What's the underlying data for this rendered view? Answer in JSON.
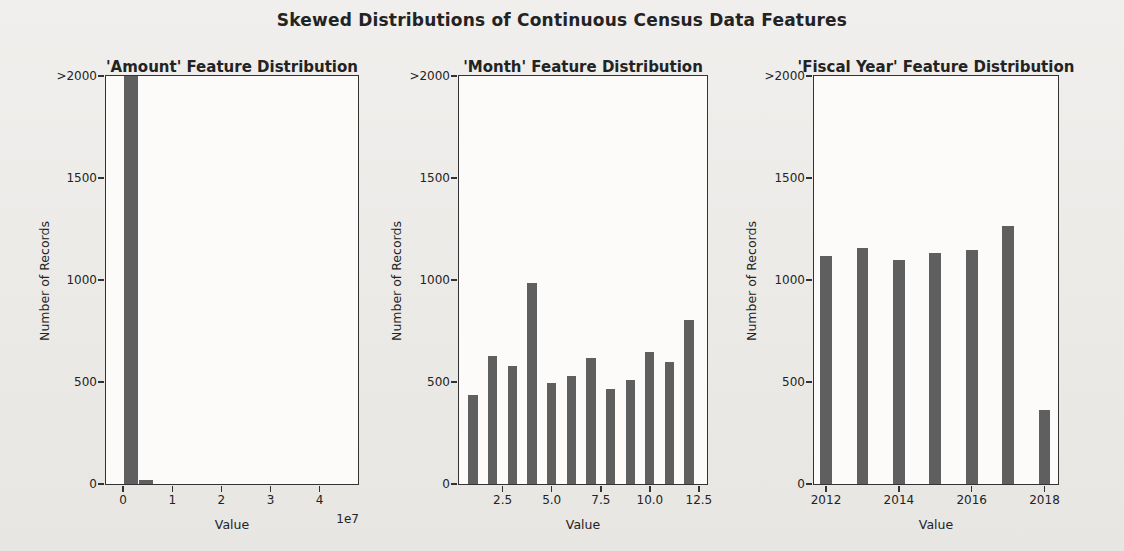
{
  "figure": {
    "title": "Skewed Distributions of Continuous Census Data Features",
    "bar_color": "#5f5f5f",
    "axis_color": "#333333",
    "text_color": "#232323"
  },
  "chart_data": [
    {
      "type": "bar",
      "title": "'Amount' Feature Distribution",
      "xlabel": "Value",
      "ylabel": "Number of Records",
      "x_offset_label": "1e7",
      "xlim": [
        -3500000,
        47800000
      ],
      "ylim": [
        0,
        2000
      ],
      "grid": false,
      "legend": null,
      "yticks": [
        {
          "value": 0,
          "label": "0"
        },
        {
          "value": 500,
          "label": "500"
        },
        {
          "value": 1000,
          "label": "1000"
        },
        {
          "value": 1500,
          "label": "1500"
        },
        {
          "value": 2000,
          "label": ">2000"
        }
      ],
      "xticks": [
        {
          "value": 0,
          "label": "0"
        },
        {
          "value": 10000000,
          "label": "1"
        },
        {
          "value": 20000000,
          "label": "2"
        },
        {
          "value": 30000000,
          "label": "3"
        },
        {
          "value": 40000000,
          "label": "4"
        }
      ],
      "bars": [
        {
          "x": 1600000,
          "width": 2900000,
          "count": 2350,
          "clipped": true
        },
        {
          "x": 4600000,
          "width": 2900000,
          "count": 20,
          "clipped": false
        }
      ]
    },
    {
      "type": "bar",
      "title": "'Month' Feature Distribution",
      "xlabel": "Value",
      "ylabel": "Number of Records",
      "x_offset_label": null,
      "xlim": [
        0.28,
        12.91
      ],
      "ylim": [
        0,
        2000
      ],
      "grid": false,
      "legend": null,
      "bar_width": 0.48,
      "yticks": [
        {
          "value": 0,
          "label": "0"
        },
        {
          "value": 500,
          "label": "500"
        },
        {
          "value": 1000,
          "label": "1000"
        },
        {
          "value": 1500,
          "label": "1500"
        },
        {
          "value": 2000,
          "label": ">2000"
        }
      ],
      "xticks": [
        {
          "value": 2.5,
          "label": "2.5"
        },
        {
          "value": 5.0,
          "label": "5.0"
        },
        {
          "value": 7.5,
          "label": "7.5"
        },
        {
          "value": 10.0,
          "label": "10.0"
        },
        {
          "value": 12.5,
          "label": "12.5"
        }
      ],
      "bars": [
        {
          "x": 1,
          "count": 435
        },
        {
          "x": 2,
          "count": 630
        },
        {
          "x": 3,
          "count": 578
        },
        {
          "x": 4,
          "count": 985
        },
        {
          "x": 5,
          "count": 495
        },
        {
          "x": 6,
          "count": 530
        },
        {
          "x": 7,
          "count": 620
        },
        {
          "x": 8,
          "count": 465
        },
        {
          "x": 9,
          "count": 510
        },
        {
          "x": 10,
          "count": 648
        },
        {
          "x": 11,
          "count": 600
        },
        {
          "x": 12,
          "count": 805
        }
      ]
    },
    {
      "type": "bar",
      "title": "'Fiscal Year' Feature Distribution",
      "xlabel": "Value",
      "ylabel": "Number of Records",
      "x_offset_label": null,
      "xlim": [
        2011.67,
        2018.37
      ],
      "ylim": [
        0,
        2000
      ],
      "grid": false,
      "legend": null,
      "bar_width": 0.32,
      "yticks": [
        {
          "value": 0,
          "label": "0"
        },
        {
          "value": 500,
          "label": "500"
        },
        {
          "value": 1000,
          "label": "1000"
        },
        {
          "value": 1500,
          "label": "1500"
        },
        {
          "value": 2000,
          "label": ">2000"
        }
      ],
      "xticks": [
        {
          "value": 2012,
          "label": "2012"
        },
        {
          "value": 2014,
          "label": "2014"
        },
        {
          "value": 2016,
          "label": "2016"
        },
        {
          "value": 2018,
          "label": "2018"
        }
      ],
      "bars": [
        {
          "x": 2012,
          "count": 1120
        },
        {
          "x": 2013,
          "count": 1155
        },
        {
          "x": 2014,
          "count": 1100
        },
        {
          "x": 2015,
          "count": 1135
        },
        {
          "x": 2016,
          "count": 1148
        },
        {
          "x": 2017,
          "count": 1265
        },
        {
          "x": 2018,
          "count": 365
        }
      ]
    }
  ]
}
